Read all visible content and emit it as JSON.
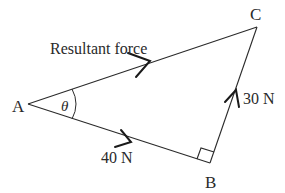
{
  "diagram": {
    "vertices": {
      "A": {
        "label": "A"
      },
      "B": {
        "label": "B"
      },
      "C": {
        "label": "C"
      }
    },
    "angle_label": "θ",
    "edges": {
      "AC": {
        "label": "Resultant force",
        "direction": "A to C"
      },
      "AB": {
        "label": "40 N",
        "direction": "A to B"
      },
      "BC": {
        "label": "30 N",
        "direction": "B to C"
      }
    },
    "right_angle_at": "B",
    "colors": {
      "line": "#2a2a2a",
      "background": "#ffffff"
    }
  }
}
